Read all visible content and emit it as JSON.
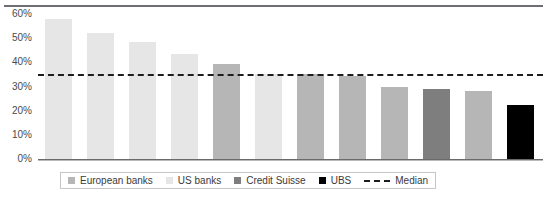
{
  "chart_data": {
    "type": "bar",
    "title": "",
    "xlabel": "",
    "ylabel": "",
    "ylim": [
      0,
      60
    ],
    "ytick_labels": [
      "60%",
      "50%",
      "40%",
      "30%",
      "20%",
      "10%",
      "0%"
    ],
    "ytick_values": [
      60,
      50,
      40,
      30,
      20,
      10,
      0
    ],
    "grid": false,
    "legend_position": "bottom",
    "categories": [
      "1",
      "2",
      "3",
      "4",
      "5",
      "6",
      "7",
      "8",
      "9",
      "10",
      "11",
      "12"
    ],
    "values": [
      57.8,
      52.0,
      48.4,
      43.6,
      39.2,
      35.2,
      35.0,
      34.2,
      29.6,
      29.0,
      28.2,
      22.4
    ],
    "bar_groups": [
      "US banks",
      "US banks",
      "US banks",
      "US banks",
      "European banks",
      "US banks",
      "European banks",
      "European banks",
      "European banks",
      "Credit Suisse",
      "European banks",
      "UBS"
    ],
    "median": 35.0,
    "median_label": "Median",
    "series_colors": {
      "European banks": "#b6b6b6",
      "US banks": "#e6e6e6",
      "Credit Suisse": "#7e7e7e",
      "UBS": "#000000",
      "Median": "#1d1d1f"
    },
    "legend": [
      {
        "label": "European banks",
        "type": "swatch",
        "color": "#b6b6b6"
      },
      {
        "label": "US banks",
        "type": "swatch",
        "color": "#e6e6e6"
      },
      {
        "label": "Credit Suisse",
        "type": "swatch",
        "color": "#7e7e7e"
      },
      {
        "label": "UBS",
        "type": "swatch",
        "color": "#000000"
      },
      {
        "label": "Median",
        "type": "dashed",
        "color": "#1d1d1f"
      }
    ]
  }
}
